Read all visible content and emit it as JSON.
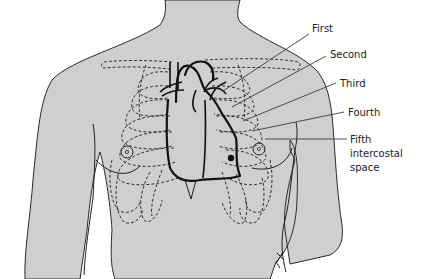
{
  "figure": {
    "labels": [
      {
        "id": "first",
        "text": "First"
      },
      {
        "id": "second",
        "text": "Second"
      },
      {
        "id": "third",
        "text": "Third"
      },
      {
        "id": "fourth",
        "text": "Fourth"
      },
      {
        "id": "fifth",
        "lines": [
          "Fifth",
          "intercostal",
          "space"
        ]
      }
    ],
    "colors": {
      "skin": "#cfcfcf",
      "outline": "#1e1e1e",
      "background": "#ffffff"
    }
  }
}
